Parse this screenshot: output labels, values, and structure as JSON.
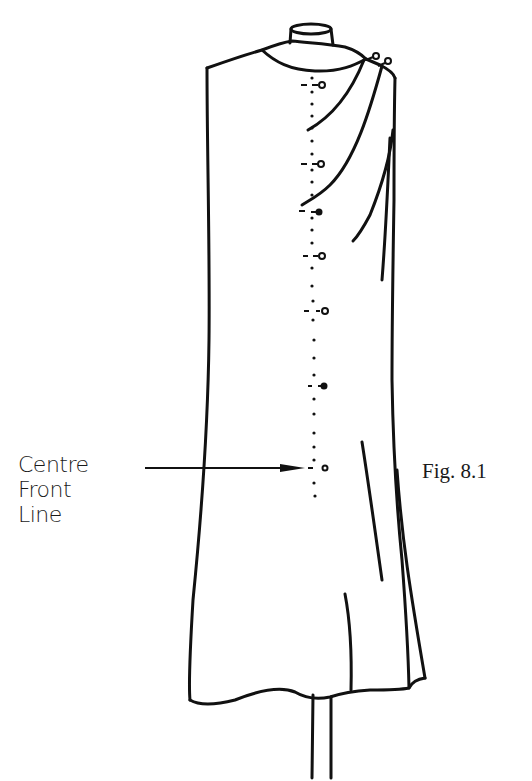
{
  "figure": {
    "caption": "Fig. 8.1"
  },
  "annotation": {
    "line1": "Centre",
    "line2": "Front",
    "line3": "Line",
    "pointer": "arrow-to-centre-front"
  },
  "centre_front": {
    "x": 315,
    "pin_y": [
      85,
      162,
      212,
      258,
      310,
      385,
      467
    ]
  },
  "colors": {
    "ink": "#111111",
    "paper": "#ffffff"
  }
}
